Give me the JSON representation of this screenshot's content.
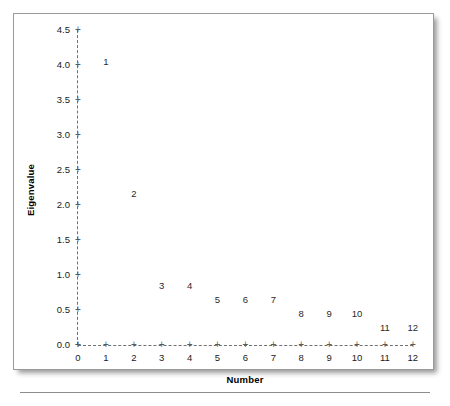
{
  "chart_data": {
    "type": "scatter",
    "title": "",
    "subtitle": "",
    "xlabel": "Number",
    "ylabel": "Eigenvalue",
    "xlim": [
      0,
      12
    ],
    "ylim": [
      0.0,
      4.5
    ],
    "grid": false,
    "legend": null,
    "marker_style": "numeric-label",
    "axis_style": "dashed-with-plus-ticks",
    "x": [
      1,
      2,
      3,
      4,
      5,
      6,
      7,
      8,
      9,
      10,
      11,
      12
    ],
    "values": [
      4.05,
      2.16,
      0.85,
      0.85,
      0.65,
      0.65,
      0.65,
      0.45,
      0.45,
      0.45,
      0.25,
      0.25
    ],
    "point_labels": [
      "1",
      "2",
      "3",
      "4",
      "5",
      "6",
      "7",
      "8",
      "9",
      "10",
      "11",
      "12"
    ],
    "xticks": [
      0,
      1,
      2,
      3,
      4,
      5,
      6,
      7,
      8,
      9,
      10,
      11,
      12
    ],
    "xtick_labels": [
      "0",
      "1",
      "2",
      "3",
      "4",
      "5",
      "6",
      "7",
      "8",
      "9",
      "10",
      "11",
      "12"
    ],
    "yticks": [
      0.0,
      0.5,
      1.0,
      1.5,
      2.0,
      2.5,
      3.0,
      3.5,
      4.0,
      4.5
    ],
    "ytick_labels": [
      "0.0",
      "0.5",
      "1.0",
      "1.5",
      "2.0",
      "2.5",
      "3.0",
      "3.5",
      "4.0",
      "4.5"
    ],
    "tick_glyph": "+"
  },
  "colors": {
    "background": "#ffffff",
    "card_border": "#9a9a9a",
    "axis": "#6f6f6f",
    "text": "#1a1a1a",
    "rule": "#8d8d8d"
  }
}
